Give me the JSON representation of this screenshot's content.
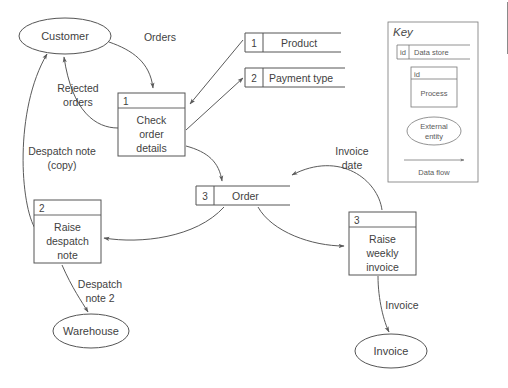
{
  "diagram": {
    "background_color": "#ffffff",
    "line_color": "#555555",
    "text_color": "#3f3f3f",
    "external_entities": [
      {
        "id": "customer",
        "label": "Customer",
        "cx": 65,
        "cy": 36,
        "rx": 46,
        "ry": 18
      },
      {
        "id": "warehouse",
        "label": "Warehouse",
        "cx": 91,
        "cy": 331,
        "rx": 38,
        "ry": 17
      },
      {
        "id": "invoice",
        "label": "Invoice",
        "cx": 391,
        "cy": 351,
        "rx": 36,
        "ry": 17
      }
    ],
    "processes": [
      {
        "id": "1",
        "label_lines": [
          "Check",
          "order",
          "details"
        ],
        "x": 118,
        "y": 93,
        "w": 67,
        "h": 63,
        "header_h": 15
      },
      {
        "id": "2",
        "label_lines": [
          "Raise",
          "despatch",
          "note"
        ],
        "x": 34,
        "y": 200,
        "w": 67,
        "h": 63,
        "header_h": 15
      },
      {
        "id": "3",
        "label_lines": [
          "Raise",
          "weekly",
          "invoice"
        ],
        "x": 349,
        "y": 212,
        "w": 67,
        "h": 63,
        "header_h": 15
      }
    ],
    "data_stores": [
      {
        "id": "1",
        "label": "Product",
        "x": 245,
        "y": 33,
        "w": 96,
        "h": 19,
        "id_w": 18
      },
      {
        "id": "2",
        "label": "Payment type",
        "x": 245,
        "y": 68,
        "w": 100,
        "h": 19,
        "id_w": 18
      },
      {
        "id": "3",
        "label": "Order",
        "x": 196,
        "y": 186,
        "w": 94,
        "h": 19,
        "id_w": 18
      }
    ],
    "flows": [
      {
        "id": "orders",
        "label": "Orders",
        "label_x": 160,
        "label_y": 41
      },
      {
        "id": "rejected-orders",
        "label_lines": [
          "Rejected",
          "orders"
        ],
        "label_x": 78,
        "label_y": 92
      },
      {
        "id": "despatch-note-copy",
        "label_lines": [
          "Despatch note",
          "(copy)"
        ],
        "label_x": 62,
        "label_y": 155
      },
      {
        "id": "despatch-note-2",
        "label_lines": [
          "Despatch",
          "note 2"
        ],
        "label_x": 100,
        "label_y": 288
      },
      {
        "id": "invoice-date",
        "label_lines": [
          "Invoice",
          "date"
        ],
        "label_x": 352,
        "label_y": 155
      },
      {
        "id": "invoice-out",
        "label": "Invoice",
        "label_x": 402,
        "label_y": 309
      }
    ]
  },
  "key": {
    "title": "Key",
    "x": 388,
    "y": 22,
    "w": 90,
    "h": 160,
    "data_store": {
      "id_label": "id",
      "label": "Data store"
    },
    "process": {
      "id_label": "id",
      "label": "Process"
    },
    "external_entity": {
      "label_lines": [
        "External",
        "entity"
      ]
    },
    "data_flow": {
      "label": "Data flow"
    }
  }
}
